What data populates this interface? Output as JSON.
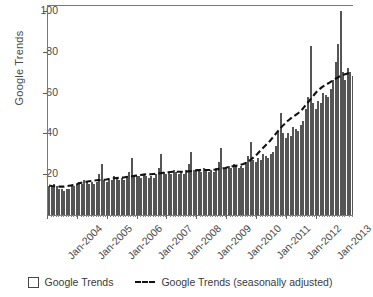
{
  "chart_data": {
    "type": "bar",
    "title": "",
    "xlabel": "",
    "ylabel": "Google Trends",
    "ylim": [
      0,
      103
    ],
    "yticks": [
      20,
      40,
      60,
      80,
      100
    ],
    "xticks": [
      "Jan-2004",
      "Jan-2005",
      "Jan-2006",
      "Jan-2007",
      "Jan-2008",
      "Jan-2009",
      "Jan-2010",
      "Jan-2011",
      "Jan-2012",
      "Jan-2013"
    ],
    "grid": false,
    "legend_position": "bottom",
    "x_start": "Jan-2004",
    "x_end": "Jun-2013",
    "series": [
      {
        "name": "Google Trends",
        "render": "bar",
        "values": [
          14,
          14,
          15,
          14,
          13,
          13,
          12,
          13,
          13,
          14,
          14,
          15,
          16,
          15,
          17,
          16,
          15,
          16,
          15,
          16,
          20,
          25,
          17,
          16,
          17,
          17,
          19,
          18,
          17,
          18,
          17,
          19,
          21,
          28,
          19,
          19,
          19,
          18,
          20,
          19,
          18,
          19,
          18,
          20,
          23,
          30,
          21,
          20,
          21,
          20,
          22,
          21,
          20,
          21,
          20,
          22,
          25,
          31,
          22,
          22,
          22,
          21,
          23,
          22,
          21,
          22,
          21,
          23,
          26,
          33,
          23,
          23,
          24,
          23,
          25,
          24,
          23,
          24,
          23,
          26,
          29,
          36,
          27,
          26,
          28,
          27,
          30,
          29,
          28,
          30,
          31,
          34,
          41,
          50,
          40,
          38,
          40,
          39,
          43,
          42,
          41,
          44,
          46,
          52,
          58,
          83,
          55,
          52,
          56,
          55,
          60,
          59,
          58,
          62,
          66,
          75,
          84,
          100,
          70,
          66,
          72,
          70,
          68
        ]
      },
      {
        "name": "Google Trends (seasonally adjusted)",
        "render": "dashed-line",
        "values": [
          14.5,
          14.3,
          14.2,
          14.1,
          14.0,
          14.0,
          14.0,
          14.2,
          14.4,
          14.6,
          14.9,
          15.2,
          15.6,
          15.9,
          16.2,
          16.4,
          16.6,
          16.8,
          17.0,
          17.1,
          17.2,
          17.3,
          17.4,
          17.5,
          17.7,
          17.9,
          18.1,
          18.2,
          18.3,
          18.4,
          18.5,
          18.7,
          18.9,
          19.0,
          19.2,
          19.4,
          19.6,
          19.7,
          19.9,
          20.0,
          20.0,
          20.1,
          20.2,
          20.3,
          20.5,
          20.6,
          20.8,
          21.0,
          21.1,
          21.2,
          21.3,
          21.3,
          21.3,
          21.3,
          21.3,
          21.4,
          21.5,
          21.6,
          21.8,
          22.0,
          22.1,
          22.1,
          22.2,
          22.2,
          22.2,
          22.2,
          22.3,
          22.4,
          22.6,
          22.8,
          23.0,
          23.2,
          23.5,
          23.7,
          24.0,
          24.2,
          24.4,
          24.7,
          25.0,
          25.5,
          26.2,
          27.0,
          28.0,
          29.0,
          30.2,
          31.5,
          32.8,
          34.0,
          35.2,
          36.5,
          38.0,
          39.5,
          41.0,
          42.5,
          43.8,
          45.0,
          46.2,
          47.2,
          48.2,
          49.0,
          49.8,
          50.8,
          52.0,
          53.5,
          55.0,
          56.5,
          58.0,
          59.5,
          61.0,
          62.0,
          63.0,
          63.8,
          64.5,
          65.2,
          66.0,
          66.8,
          67.5,
          68.2,
          68.8,
          69.2,
          69.6,
          70.0,
          70.3
        ]
      }
    ]
  },
  "legend": {
    "bars_label": "Google Trends",
    "line_label": "Google Trends (seasonally adjusted)"
  }
}
